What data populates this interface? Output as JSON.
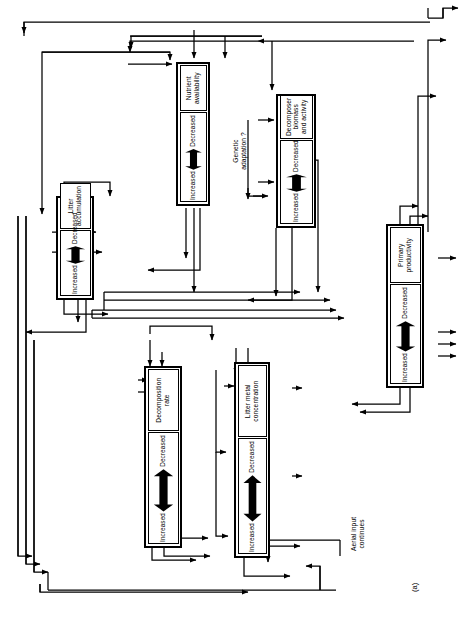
{
  "figure": {
    "panel_label": "(a)",
    "caption_note": "",
    "orientation": "rotated-90",
    "ink_color": "#000000",
    "paper_color": "#ffffff"
  },
  "scale_labels": {
    "high": "Decreased",
    "low": "Increased"
  },
  "nodes": [
    {
      "id": "nutrient-availability",
      "label": "Nutrient availability",
      "top_label": "Decreased",
      "bottom_label": "Increased"
    },
    {
      "id": "decomposer-biomass-and-activity",
      "label": "Decomposer biomass\nand activity",
      "top_label": "Decreased",
      "bottom_label": "Increased"
    },
    {
      "id": "litter-accumulation",
      "label": "Litter accumulation",
      "top_label": "Decreased",
      "bottom_label": "Increased"
    },
    {
      "id": "decomposition-rate",
      "label": "Decomposition rate",
      "top_label": "Decreased",
      "bottom_label": "Increased"
    },
    {
      "id": "litter-metal-concentration",
      "label": "Litter metal concentration",
      "top_label": "Decreased",
      "bottom_label": "Increased"
    },
    {
      "id": "primary-productivity",
      "label": "Primary productivity",
      "top_label": "Decreased",
      "bottom_label": "Increased"
    }
  ],
  "annotations": [
    {
      "id": "genetic-adaptation",
      "text": "Genetic\nadaptation ?"
    },
    {
      "id": "aerial-input-continues",
      "text": "Aerial input\ncontinues"
    }
  ]
}
